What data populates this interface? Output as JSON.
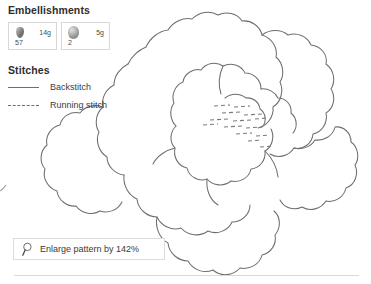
{
  "embellishments": {
    "heading": "Embellishments",
    "items": [
      {
        "code": "57",
        "weight": "14g",
        "icon": "bead-icon"
      },
      {
        "code": "2",
        "weight": "5g",
        "icon": "bead-icon"
      }
    ]
  },
  "stitches": {
    "heading": "Stitches",
    "legend": [
      {
        "label": "Backstitch",
        "style": "solid",
        "sample_icon": "solid-line-icon"
      },
      {
        "label": "Running stitch",
        "style": "dashed",
        "sample_icon": "dashed-line-icon"
      }
    ]
  },
  "enlarge": {
    "label": "Enlarge pattern by 142%",
    "icon": "magnifier-icon"
  },
  "colors": {
    "line": "#6e6e6e",
    "text": "#3a3a3a",
    "border": "#dcdcdc",
    "rule": "#d9d9d9",
    "page_background": "#ffffff"
  }
}
